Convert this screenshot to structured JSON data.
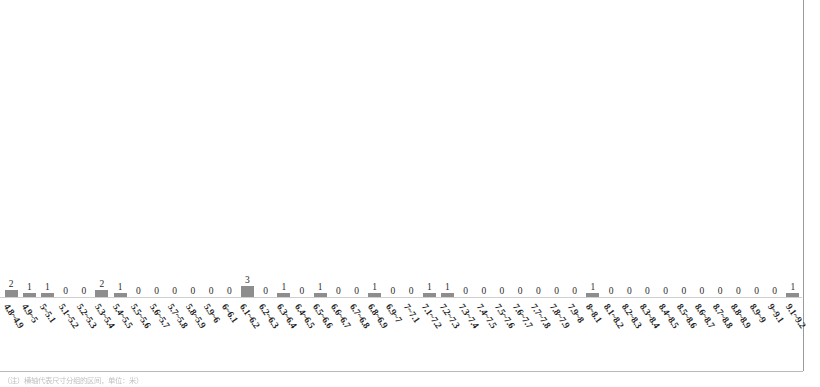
{
  "page": {
    "background_color": "#ffffff",
    "border_color": "#9a9a9a"
  },
  "footer": {
    "caption": "（注）横轴代表尺寸分组的区间，单位：米）"
  },
  "chart_data": {
    "type": "bar",
    "title": "",
    "subtitle": "",
    "xlabel": "",
    "ylabel": "",
    "grid": false,
    "legend": false,
    "ylim": [
      0,
      3
    ],
    "bar_color": "#8d8d8d",
    "axis_color": "#cfcfcf",
    "data_labels": true,
    "categories": [
      "4.8~4.9",
      "4.9~5",
      "5~5.1",
      "5.1~5.2",
      "5.2~5.3",
      "5.3~5.4",
      "5.4~5.5",
      "5.5~5.6",
      "5.6~5.7",
      "5.7~5.8",
      "5.8~5.9",
      "5.9~6",
      "6~6.1",
      "6.1~6.2",
      "6.2~6.3",
      "6.3~6.4",
      "6.4~6.5",
      "6.5~6.6",
      "6.6~6.7",
      "6.7~6.8",
      "6.8~6.9",
      "6.9~7",
      "7~7.1",
      "7.1~7.2",
      "7.2~7.3",
      "7.3~7.4",
      "7.4~7.5",
      "7.5~7.6",
      "7.6~7.7",
      "7.7~7.8",
      "7.8~7.9",
      "7.9~8",
      "8~8.1",
      "8.1~8.2",
      "8.2~8.3",
      "8.3~8.4",
      "8.4~8.5",
      "8.5~8.6",
      "8.6~8.7",
      "8.7~8.8",
      "8.8~8.9",
      "8.9~9",
      "9~9.1",
      "9.1~9.2"
    ],
    "values": [
      2,
      1,
      1,
      0,
      0,
      2,
      1,
      0,
      0,
      0,
      0,
      0,
      0,
      3,
      0,
      1,
      0,
      1,
      0,
      0,
      1,
      0,
      0,
      1,
      1,
      0,
      0,
      0,
      0,
      0,
      0,
      0,
      1,
      0,
      0,
      0,
      0,
      0,
      0,
      0,
      0,
      0,
      0,
      1
    ]
  }
}
